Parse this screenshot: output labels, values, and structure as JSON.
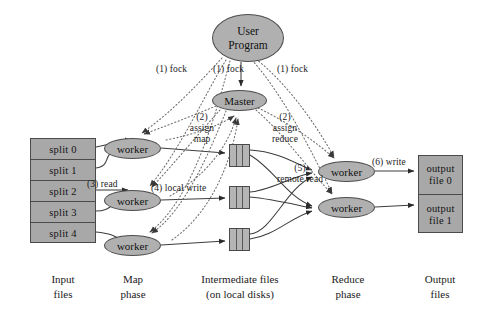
{
  "diagram": {
    "background_color": "#ffffff",
    "node_fill_color": "#b0b0b0",
    "file_fill_color": "#a8a8a8",
    "stroke_color": "#4a4a4a",
    "text_color": "#1b1b1b"
  },
  "input": {
    "splits": [
      {
        "label": "split 0"
      },
      {
        "label": "split 1"
      },
      {
        "label": "split 2"
      },
      {
        "label": "split 3"
      },
      {
        "label": "split 4"
      }
    ]
  },
  "nodes": {
    "user_program": {
      "line1": "User",
      "line2": "Program"
    },
    "master": {
      "label": "Master"
    },
    "map_workers": [
      {
        "label": "worker"
      },
      {
        "label": "worker"
      },
      {
        "label": "worker"
      }
    ],
    "reduce_workers": [
      {
        "label": "worker"
      },
      {
        "label": "worker"
      }
    ]
  },
  "intermediate": {
    "boxes": [
      {
        "name": "intermediate-file-0"
      },
      {
        "name": "intermediate-file-1"
      },
      {
        "name": "intermediate-file-2"
      }
    ]
  },
  "output": {
    "files": [
      {
        "line1": "output",
        "line2": "file 0"
      },
      {
        "line1": "output",
        "line2": "file 1"
      }
    ]
  },
  "edge_labels": {
    "fork_left": "(1) fock",
    "fork_center": "(1) fock",
    "fork_right": "(1) fock",
    "assign_map": "(2)\nassign\nmap",
    "assign_map_num": "(2)",
    "assign_map_l1": "assign",
    "assign_map_l2": "map",
    "assign_reduce_num": "(2)",
    "assign_reduce_l1": "assign",
    "assign_reduce_l2": "reduce",
    "read": "(3) read",
    "local_write": "(4) local write",
    "remote_read_num": "(5)",
    "remote_read_l1": "remote read",
    "write": "(6) write"
  },
  "captions": {
    "input": {
      "line1": "Input",
      "line2": "files"
    },
    "map": {
      "line1": "Map",
      "line2": "phase"
    },
    "intermediate": {
      "line1": "Intermediate files",
      "line2": "(on local disks)"
    },
    "reduce": {
      "line1": "Reduce",
      "line2": "phase"
    },
    "output": {
      "line1": "Output",
      "line2": "files"
    }
  }
}
